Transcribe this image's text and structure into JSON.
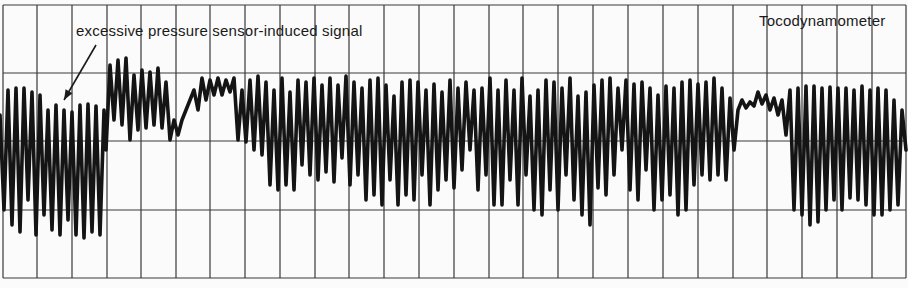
{
  "chart_data": {
    "type": "line",
    "title": "Tocodynamometer",
    "annotation": "excessive pressure sensor-induced signal",
    "annotation_arrow": {
      "from": [
        96,
        45
      ],
      "to": [
        64,
        100
      ]
    },
    "grid": {
      "vertical_x": [
        3,
        37,
        72,
        107,
        141,
        176,
        210,
        245,
        280,
        315,
        349,
        384,
        419,
        454,
        489,
        523,
        558,
        593,
        628,
        663,
        698,
        733,
        767,
        802,
        837,
        872,
        906
      ],
      "horizontal_y": [
        5,
        73,
        141,
        210,
        278
      ],
      "color": "#3a3a3a"
    },
    "trace_color": "#141414",
    "xlabel": "",
    "ylabel": "",
    "segments": [
      {
        "name": "artifact-region",
        "x_range": [
          0,
          105
        ],
        "amplitude": "high",
        "y_range": [
          88,
          238
        ]
      },
      {
        "name": "elevated-region",
        "x_range": [
          105,
          175
        ],
        "y_range": [
          58,
          150
        ]
      },
      {
        "name": "normal-region",
        "x_range": [
          175,
          735
        ],
        "y_range": [
          72,
          226
        ]
      },
      {
        "name": "quiet-region",
        "x_range": [
          735,
          790
        ],
        "y_range": [
          85,
          135
        ]
      },
      {
        "name": "normal-region-2",
        "x_range": [
          790,
          908
        ],
        "y_range": [
          85,
          225
        ]
      }
    ],
    "points": [
      [
        0,
        115
      ],
      [
        4,
        210
      ],
      [
        8,
        90
      ],
      [
        12,
        225
      ],
      [
        16,
        88
      ],
      [
        20,
        232
      ],
      [
        24,
        88
      ],
      [
        28,
        200
      ],
      [
        32,
        92
      ],
      [
        36,
        235
      ],
      [
        40,
        95
      ],
      [
        44,
        215
      ],
      [
        48,
        110
      ],
      [
        52,
        230
      ],
      [
        56,
        105
      ],
      [
        60,
        235
      ],
      [
        64,
        110
      ],
      [
        68,
        220
      ],
      [
        72,
        112
      ],
      [
        76,
        235
      ],
      [
        80,
        105
      ],
      [
        84,
        238
      ],
      [
        88,
        104
      ],
      [
        92,
        232
      ],
      [
        96,
        106
      ],
      [
        100,
        235
      ],
      [
        104,
        110
      ],
      [
        106,
        150
      ],
      [
        110,
        65
      ],
      [
        114,
        120
      ],
      [
        118,
        60
      ],
      [
        122,
        125
      ],
      [
        126,
        58
      ],
      [
        130,
        140
      ],
      [
        134,
        75
      ],
      [
        138,
        130
      ],
      [
        142,
        70
      ],
      [
        146,
        128
      ],
      [
        150,
        72
      ],
      [
        154,
        125
      ],
      [
        158,
        68
      ],
      [
        162,
        128
      ],
      [
        166,
        82
      ],
      [
        170,
        140
      ],
      [
        174,
        120
      ],
      [
        178,
        135
      ],
      [
        182,
        120
      ],
      [
        186,
        110
      ],
      [
        190,
        100
      ],
      [
        194,
        90
      ],
      [
        198,
        110
      ],
      [
        202,
        78
      ],
      [
        206,
        100
      ],
      [
        210,
        80
      ],
      [
        214,
        95
      ],
      [
        218,
        78
      ],
      [
        222,
        95
      ],
      [
        226,
        80
      ],
      [
        230,
        92
      ],
      [
        234,
        78
      ],
      [
        238,
        140
      ],
      [
        242,
        90
      ],
      [
        246,
        142
      ],
      [
        250,
        80
      ],
      [
        254,
        150
      ],
      [
        258,
        76
      ],
      [
        262,
        155
      ],
      [
        266,
        82
      ],
      [
        270,
        185
      ],
      [
        274,
        90
      ],
      [
        278,
        190
      ],
      [
        282,
        78
      ],
      [
        286,
        185
      ],
      [
        290,
        92
      ],
      [
        294,
        190
      ],
      [
        298,
        80
      ],
      [
        302,
        165
      ],
      [
        306,
        82
      ],
      [
        310,
        175
      ],
      [
        314,
        78
      ],
      [
        318,
        180
      ],
      [
        322,
        85
      ],
      [
        326,
        172
      ],
      [
        330,
        78
      ],
      [
        334,
        182
      ],
      [
        338,
        85
      ],
      [
        342,
        158
      ],
      [
        346,
        76
      ],
      [
        350,
        185
      ],
      [
        354,
        82
      ],
      [
        358,
        175
      ],
      [
        362,
        88
      ],
      [
        366,
        200
      ],
      [
        370,
        80
      ],
      [
        374,
        195
      ],
      [
        378,
        78
      ],
      [
        382,
        205
      ],
      [
        386,
        85
      ],
      [
        390,
        180
      ],
      [
        394,
        96
      ],
      [
        398,
        205
      ],
      [
        402,
        82
      ],
      [
        406,
        195
      ],
      [
        410,
        80
      ],
      [
        414,
        200
      ],
      [
        418,
        82
      ],
      [
        422,
        175
      ],
      [
        426,
        90
      ],
      [
        430,
        205
      ],
      [
        434,
        84
      ],
      [
        438,
        190
      ],
      [
        442,
        92
      ],
      [
        446,
        180
      ],
      [
        450,
        80
      ],
      [
        454,
        188
      ],
      [
        458,
        88
      ],
      [
        462,
        170
      ],
      [
        466,
        82
      ],
      [
        470,
        150
      ],
      [
        474,
        90
      ],
      [
        478,
        190
      ],
      [
        482,
        88
      ],
      [
        486,
        175
      ],
      [
        490,
        78
      ],
      [
        494,
        205
      ],
      [
        498,
        90
      ],
      [
        502,
        205
      ],
      [
        506,
        80
      ],
      [
        510,
        180
      ],
      [
        514,
        90
      ],
      [
        518,
        205
      ],
      [
        522,
        78
      ],
      [
        526,
        175
      ],
      [
        530,
        96
      ],
      [
        534,
        210
      ],
      [
        538,
        90
      ],
      [
        542,
        215
      ],
      [
        546,
        80
      ],
      [
        550,
        190
      ],
      [
        554,
        82
      ],
      [
        558,
        210
      ],
      [
        562,
        88
      ],
      [
        566,
        175
      ],
      [
        570,
        78
      ],
      [
        574,
        200
      ],
      [
        578,
        96
      ],
      [
        582,
        215
      ],
      [
        586,
        92
      ],
      [
        590,
        225
      ],
      [
        594,
        85
      ],
      [
        598,
        188
      ],
      [
        602,
        80
      ],
      [
        606,
        195
      ],
      [
        610,
        78
      ],
      [
        614,
        175
      ],
      [
        618,
        88
      ],
      [
        622,
        150
      ],
      [
        626,
        80
      ],
      [
        630,
        190
      ],
      [
        634,
        84
      ],
      [
        638,
        200
      ],
      [
        642,
        82
      ],
      [
        646,
        170
      ],
      [
        650,
        88
      ],
      [
        654,
        210
      ],
      [
        658,
        95
      ],
      [
        662,
        200
      ],
      [
        666,
        86
      ],
      [
        670,
        195
      ],
      [
        674,
        88
      ],
      [
        678,
        215
      ],
      [
        682,
        82
      ],
      [
        686,
        210
      ],
      [
        690,
        80
      ],
      [
        694,
        185
      ],
      [
        698,
        84
      ],
      [
        702,
        175
      ],
      [
        706,
        82
      ],
      [
        710,
        180
      ],
      [
        714,
        78
      ],
      [
        718,
        175
      ],
      [
        722,
        88
      ],
      [
        726,
        180
      ],
      [
        730,
        98
      ],
      [
        734,
        150
      ],
      [
        738,
        110
      ],
      [
        742,
        100
      ],
      [
        746,
        108
      ],
      [
        750,
        102
      ],
      [
        754,
        106
      ],
      [
        758,
        92
      ],
      [
        762,
        104
      ],
      [
        766,
        95
      ],
      [
        770,
        110
      ],
      [
        774,
        98
      ],
      [
        778,
        115
      ],
      [
        782,
        100
      ],
      [
        786,
        135
      ],
      [
        790,
        90
      ],
      [
        794,
        210
      ],
      [
        798,
        88
      ],
      [
        802,
        215
      ],
      [
        806,
        86
      ],
      [
        810,
        225
      ],
      [
        814,
        86
      ],
      [
        818,
        222
      ],
      [
        822,
        88
      ],
      [
        826,
        210
      ],
      [
        830,
        87
      ],
      [
        834,
        200
      ],
      [
        838,
        88
      ],
      [
        842,
        210
      ],
      [
        846,
        88
      ],
      [
        850,
        198
      ],
      [
        854,
        90
      ],
      [
        858,
        200
      ],
      [
        862,
        86
      ],
      [
        866,
        205
      ],
      [
        870,
        90
      ],
      [
        874,
        215
      ],
      [
        878,
        88
      ],
      [
        882,
        215
      ],
      [
        886,
        90
      ],
      [
        890,
        210
      ],
      [
        894,
        100
      ],
      [
        898,
        205
      ],
      [
        902,
        110
      ],
      [
        906,
        150
      ]
    ]
  }
}
